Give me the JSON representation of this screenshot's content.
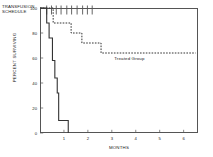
{
  "annotations": {
    "transfusion_schedule_line1": "TRANSFUSION",
    "transfusion_schedule_line2": "SCHEDULE",
    "treated_group_label": "Treated Group"
  },
  "chart_data": {
    "type": "line",
    "title": "",
    "subtitle": "",
    "xlabel": "MONTHS",
    "ylabel": "PERCENT SURVIVING",
    "xlim": [
      0,
      6.6
    ],
    "ylim": [
      0,
      100
    ],
    "grid": false,
    "legend_position": "inline-annotation",
    "x_ticks": [
      1,
      2,
      3,
      4,
      5,
      6
    ],
    "x_tick_labels": [
      "1",
      "2",
      "3",
      "4",
      "5",
      "6"
    ],
    "y_ticks": [
      0,
      20,
      40,
      60,
      80,
      100
    ],
    "y_tick_labels": [
      "0",
      "20",
      "40",
      "60",
      "80",
      "100"
    ],
    "series": [
      {
        "name": "Treated Group",
        "style": "dashed",
        "color": "#333333",
        "step": "post",
        "points": [
          [
            0.0,
            100
          ],
          [
            0.55,
            100
          ],
          [
            0.55,
            88
          ],
          [
            1.3,
            88
          ],
          [
            1.3,
            80
          ],
          [
            1.75,
            80
          ],
          [
            1.75,
            72
          ],
          [
            2.55,
            72
          ],
          [
            2.55,
            64
          ],
          [
            6.5,
            64
          ]
        ]
      },
      {
        "name": "Control Group",
        "style": "solid",
        "color": "#333333",
        "step": "post",
        "points": [
          [
            0.0,
            100
          ],
          [
            0.28,
            100
          ],
          [
            0.28,
            88
          ],
          [
            0.38,
            88
          ],
          [
            0.38,
            76
          ],
          [
            0.52,
            76
          ],
          [
            0.52,
            58
          ],
          [
            0.62,
            58
          ],
          [
            0.62,
            44
          ],
          [
            0.72,
            44
          ],
          [
            0.72,
            32
          ],
          [
            0.78,
            32
          ],
          [
            0.78,
            10
          ],
          [
            1.18,
            10
          ],
          [
            1.18,
            0
          ]
        ]
      }
    ],
    "transfusion_marks": {
      "label": "TRANSFUSION SCHEDULE",
      "x_values": [
        0.28,
        0.48,
        0.68,
        0.88,
        1.12,
        1.32,
        1.55,
        1.78,
        1.98,
        2.18
      ]
    }
  }
}
